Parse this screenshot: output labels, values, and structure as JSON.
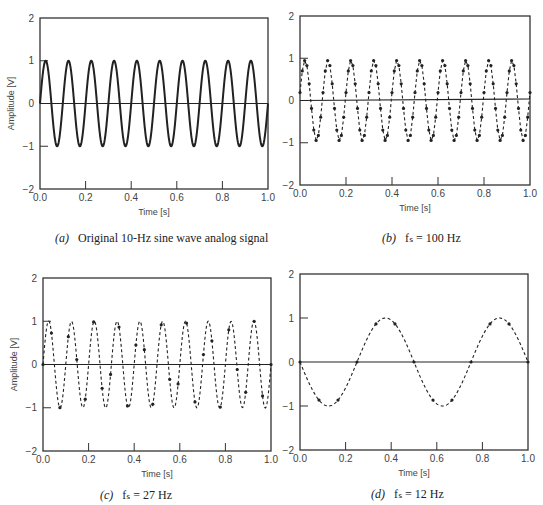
{
  "figure": {
    "panels": [
      {
        "id": "a",
        "caption_label": "(a)",
        "caption_text": "Original 10-Hz sine wave analog signal"
      },
      {
        "id": "b",
        "caption_label": "(b)",
        "caption_text": "fₛ = 100 Hz"
      },
      {
        "id": "c",
        "caption_label": "(c)",
        "caption_text": "fₛ = 27 Hz"
      },
      {
        "id": "d",
        "caption_label": "(d)",
        "caption_text": "fₛ = 12 Hz"
      }
    ]
  },
  "chart_data": [
    {
      "id": "a",
      "type": "line",
      "title": "(a) Original 10-Hz sine wave analog signal",
      "xlabel": "Time [s]",
      "ylabel": "Amplitude [V]",
      "xlim": [
        0.0,
        1.0
      ],
      "ylim": [
        -2,
        2
      ],
      "xticks": [
        "0.0",
        "0.2",
        "0.4",
        "0.6",
        "0.8",
        "1.0"
      ],
      "yticks": [
        "-2",
        "-1",
        "0",
        "1",
        "2"
      ],
      "grid": false,
      "series": [
        {
          "name": "analog signal",
          "function": "sin(2*pi*10*t)",
          "frequency_hz": 10,
          "amplitude": 1,
          "style": "solid"
        }
      ]
    },
    {
      "id": "b",
      "type": "line",
      "title": "(b) fs = 100 Hz",
      "xlabel": "Time [s]",
      "ylabel": "",
      "xlim": [
        0.0,
        1.0
      ],
      "ylim": [
        -2,
        2
      ],
      "xticks": [
        "0.0",
        "0.2",
        "0.4",
        "0.6",
        "0.8",
        "1.0"
      ],
      "yticks": [
        "-2",
        "-1",
        "0",
        "1",
        "2"
      ],
      "grid": false,
      "series": [
        {
          "name": "sampled reconstruction",
          "sampling_rate_hz": 100,
          "signal_frequency_hz": 10,
          "samples_per_period": 10,
          "peak_sample_value": 0.95,
          "markers": true,
          "style": "dashed"
        }
      ]
    },
    {
      "id": "c",
      "type": "line",
      "title": "(c) fs = 27 Hz",
      "xlabel": "Time [s]",
      "ylabel": "Amplitude [V]",
      "xlim": [
        0.0,
        1.0
      ],
      "ylim": [
        -2,
        2
      ],
      "xticks": [
        "0.0",
        "0.2",
        "0.4",
        "0.6",
        "0.8",
        "1.0"
      ],
      "yticks": [
        "-2",
        "-1",
        "0",
        "1",
        "2"
      ],
      "grid": false,
      "series": [
        {
          "name": "sampled reconstruction",
          "sampling_rate_hz": 27,
          "signal_frequency_hz": 10,
          "peak_values": [
            0.7,
            1.0
          ],
          "markers": true,
          "style": "dashed"
        }
      ]
    },
    {
      "id": "d",
      "type": "line",
      "title": "(d) fs = 12 Hz",
      "xlabel": "Time [s]",
      "ylabel": "",
      "xlim": [
        0.0,
        1.0
      ],
      "ylim": [
        -2,
        2
      ],
      "xticks": [
        "0.0",
        "0.2",
        "0.4",
        "0.6",
        "0.8",
        "1.0"
      ],
      "yticks": [
        "-2",
        "-1",
        "0",
        "1",
        "2"
      ],
      "grid": false,
      "series": [
        {
          "name": "aliased 2-Hz signal",
          "sampling_rate_hz": 12,
          "alias_frequency_hz": 2,
          "function": "-sin(2*pi*2*t)",
          "markers": true,
          "style": "dashed"
        }
      ]
    }
  ],
  "layout": {
    "frames": {
      "a": [
        40,
        18,
        268,
        189
      ],
      "b": [
        300,
        16,
        530,
        185
      ],
      "c": [
        43,
        278,
        271,
        451
      ],
      "d": [
        300,
        274,
        528,
        450
      ]
    },
    "line_color": "#222222",
    "axis_color": "#333333"
  }
}
